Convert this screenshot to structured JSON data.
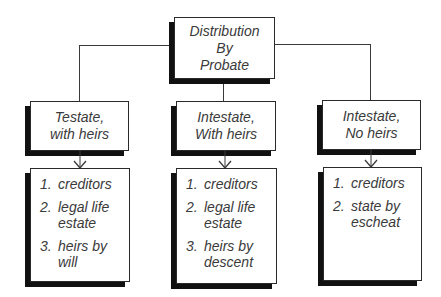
{
  "root": {
    "lines": [
      "Distribution",
      "By",
      "Probate"
    ]
  },
  "branches": [
    {
      "heading": [
        "Testate,",
        "with heirs"
      ],
      "items": [
        {
          "num": "1.",
          "text": "creditors"
        },
        {
          "num": "2.",
          "text": "legal life estate"
        },
        {
          "num": "3.",
          "text": "heirs by will"
        }
      ]
    },
    {
      "heading": [
        "Intestate,",
        "With heirs"
      ],
      "items": [
        {
          "num": "1.",
          "text": "creditors"
        },
        {
          "num": "2.",
          "text": "legal life estate"
        },
        {
          "num": "3.",
          "text": "heirs by descent"
        }
      ]
    },
    {
      "heading": [
        "Intestate,",
        "No heirs"
      ],
      "items": [
        {
          "num": "1.",
          "text": "creditors"
        },
        {
          "num": "2.",
          "text": "state by escheat"
        }
      ]
    }
  ],
  "colors": {
    "border": "#2a2a2a",
    "shadow": "#111111",
    "text": "#3a3a3a",
    "background": "#ffffff"
  }
}
